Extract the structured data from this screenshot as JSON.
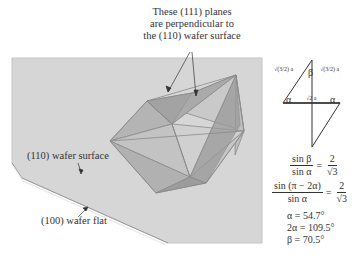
{
  "figure": {
    "annotation_top": [
      "These (111) planes",
      "are perpendicular to",
      "the (110) wafer surface"
    ],
    "label_wafer_surface": "(110) wafer surface",
    "label_wafer_flat": "(100) wafer flat"
  },
  "triangle": {
    "apex_angle": "β",
    "base_left_angle": "α",
    "base_right_angle": "α",
    "side_left": "√(3/2) a",
    "side_right": "√(3/2) a",
    "base": "√2 a"
  },
  "equations": {
    "eq1": {
      "num": "sin β",
      "den": "sin α",
      "rhs_num": "2",
      "rhs_den": "√3"
    },
    "eq2": {
      "num": "sin (π − 2α)",
      "den": "sin α",
      "rhs_num": "2",
      "rhs_den": "√3"
    },
    "results": [
      "α = 54.7°",
      "2α = 109.5°",
      "β = 70.5°"
    ]
  },
  "colors": {
    "wafer": "#d4d4d4",
    "wafer_edge": "#bdbdbd",
    "crystal_light": "#c8c8c8",
    "crystal_mid": "#a9a9a9",
    "crystal_dark": "#8f8f8f",
    "line": "#333333"
  }
}
